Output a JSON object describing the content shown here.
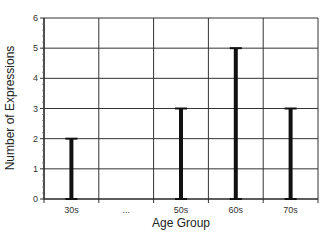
{
  "chart_data": {
    "type": "bar",
    "title": "",
    "xlabel": "Age Group",
    "ylabel": "Number of Expressions",
    "categories": [
      "30s",
      "...",
      "50s",
      "60s",
      "70s"
    ],
    "values": [
      2,
      null,
      3,
      5,
      3
    ],
    "ylim": [
      0,
      6
    ],
    "yticks": [
      0,
      1,
      2,
      3,
      4,
      5,
      6
    ],
    "grid": true,
    "legend": null,
    "style": "capped thin bars (I-beam)"
  },
  "colors": {
    "bar": "#111111",
    "grid": "#333333",
    "background": "#ffffff"
  }
}
